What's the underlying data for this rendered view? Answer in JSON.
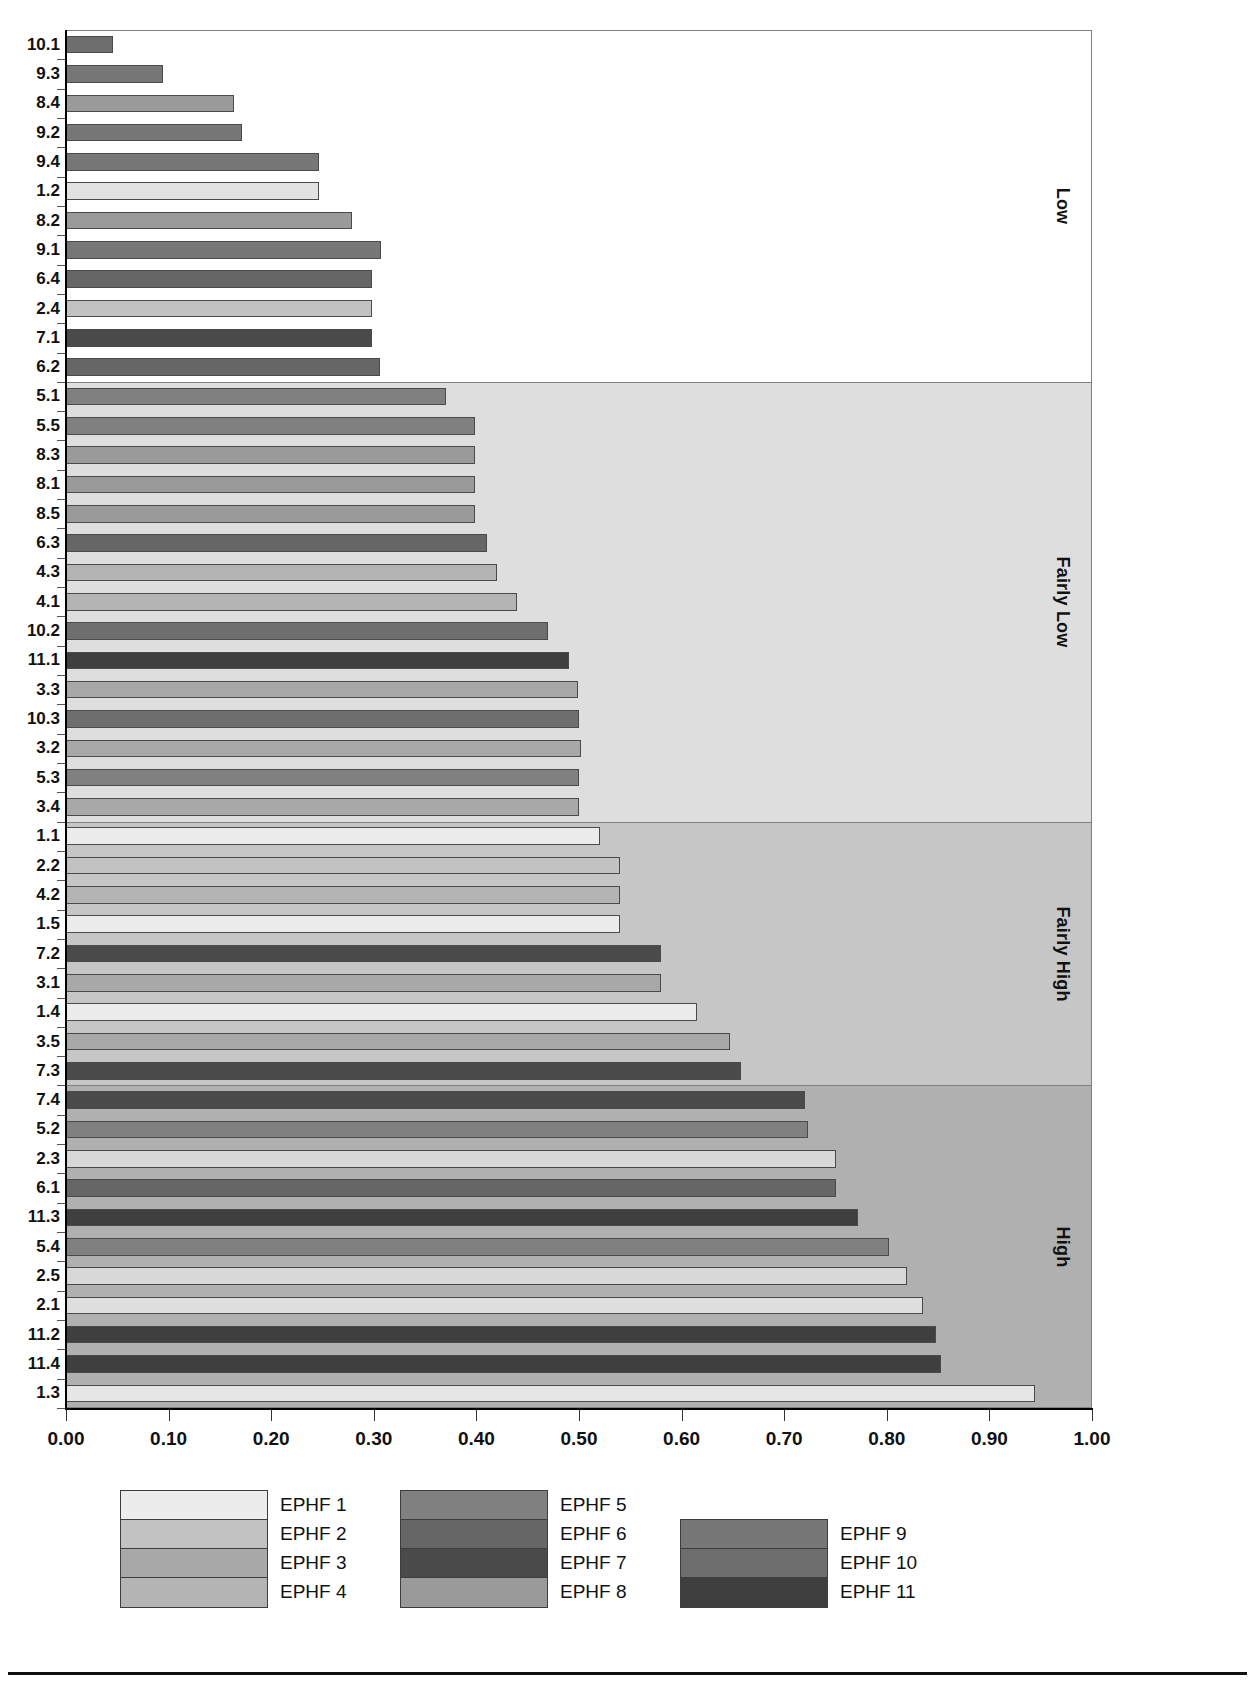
{
  "chart_data": {
    "type": "bar",
    "orientation": "horizontal",
    "title": "",
    "xlabel": "",
    "ylabel": "",
    "xlim": [
      0.0,
      1.0
    ],
    "xticks": [
      "0.00",
      "0.10",
      "0.20",
      "0.30",
      "0.40",
      "0.50",
      "0.60",
      "0.70",
      "0.80",
      "0.90",
      "1.00"
    ],
    "xtick_values": [
      0.0,
      0.1,
      0.2,
      0.3,
      0.4,
      0.5,
      0.6,
      0.7,
      0.8,
      0.9,
      1.0
    ],
    "grid": false,
    "legend_position": "bottom",
    "categories": [
      "10.1",
      "9.3",
      "8.4",
      "9.2",
      "9.4",
      "1.2",
      "8.2",
      "9.1",
      "6.4",
      "2.4",
      "7.1",
      "6.2",
      "5.1",
      "5.5",
      "8.3",
      "8.1",
      "8.5",
      "6.3",
      "4.3",
      "4.1",
      "10.2",
      "11.1",
      "3.3",
      "10.3",
      "3.2",
      "5.3",
      "3.4",
      "1.1",
      "2.2",
      "4.2",
      "1.5",
      "7.2",
      "3.1",
      "1.4",
      "3.5",
      "7.3",
      "7.4",
      "5.2",
      "2.3",
      "6.1",
      "11.3",
      "5.4",
      "2.5",
      "2.1",
      "11.2",
      "11.4",
      "1.3"
    ],
    "values": [
      0.046,
      0.095,
      0.164,
      0.172,
      0.247,
      0.247,
      0.279,
      0.307,
      0.298,
      0.298,
      0.298,
      0.306,
      0.37,
      0.399,
      0.399,
      0.399,
      0.399,
      0.41,
      0.42,
      0.44,
      0.47,
      0.49,
      0.499,
      0.5,
      0.502,
      0.5,
      0.5,
      0.52,
      0.54,
      0.54,
      0.54,
      0.58,
      0.58,
      0.615,
      0.647,
      0.658,
      0.72,
      0.723,
      0.75,
      0.75,
      0.772,
      0.802,
      0.82,
      0.835,
      0.848,
      0.853,
      0.944
    ],
    "series_of_bar": [
      "EPHF 10",
      "EPHF 9",
      "EPHF 8",
      "EPHF 9",
      "EPHF 9",
      "EPHF 1",
      "EPHF 8",
      "EPHF 9",
      "EPHF 6",
      "EPHF 2",
      "EPHF 7",
      "EPHF 6",
      "EPHF 5",
      "EPHF 5",
      "EPHF 8",
      "EPHF 8",
      "EPHF 8",
      "EPHF 6",
      "EPHF 4",
      "EPHF 4",
      "EPHF 10",
      "EPHF 11",
      "EPHF 3",
      "EPHF 10",
      "EPHF 3",
      "EPHF 5",
      "EPHF 3",
      "EPHF 1",
      "EPHF 2",
      "EPHF 4",
      "EPHF 1",
      "EPHF 7",
      "EPHF 3",
      "EPHF 1",
      "EPHF 3",
      "EPHF 7",
      "EPHF 7",
      "EPHF 5",
      "EPHF 2",
      "EPHF 6",
      "EPHF 11",
      "EPHF 5",
      "EPHF 2",
      "EPHF 2",
      "EPHF 11",
      "EPHF 11",
      "EPHF 1"
    ],
    "bar_colors": [
      "#6e6e6e",
      "#777777",
      "#9a9a9a",
      "#777777",
      "#777777",
      "#e2e2e2",
      "#9a9a9a",
      "#777777",
      "#666666",
      "#c2c2c2",
      "#4a4a4a",
      "#666666",
      "#808080",
      "#808080",
      "#9a9a9a",
      "#9a9a9a",
      "#9a9a9a",
      "#666666",
      "#b4b4b4",
      "#b4b4b4",
      "#6e6e6e",
      "#3f3f3f",
      "#a8a8a8",
      "#6e6e6e",
      "#a8a8a8",
      "#808080",
      "#a8a8a8",
      "#ececec",
      "#c2c2c2",
      "#b4b4b4",
      "#ececec",
      "#4a4a4a",
      "#a8a8a8",
      "#ececec",
      "#a8a8a8",
      "#4a4a4a",
      "#4a4a4a",
      "#808080",
      "#d8d8d8",
      "#666666",
      "#3f3f3f",
      "#808080",
      "#d8d8d8",
      "#dedede",
      "#3f3f3f",
      "#3f3f3f",
      "#e6e6e6"
    ],
    "bands": [
      {
        "label": "Low",
        "from_index": 0,
        "to_index": 11,
        "color": "#ffffff"
      },
      {
        "label": "Fairly Low",
        "from_index": 12,
        "to_index": 26,
        "color": "#dedede"
      },
      {
        "label": "Fairly High",
        "from_index": 27,
        "to_index": 35,
        "color": "#c6c6c6"
      },
      {
        "label": "High",
        "from_index": 36,
        "to_index": 46,
        "color": "#b0b0b0"
      }
    ],
    "legend": [
      {
        "label": "EPHF 1",
        "color": "#ececec"
      },
      {
        "label": "EPHF 2",
        "color": "#c2c2c2"
      },
      {
        "label": "EPHF 3",
        "color": "#a8a8a8"
      },
      {
        "label": "EPHF 4",
        "color": "#b4b4b4"
      },
      {
        "label": "EPHF 5",
        "color": "#808080"
      },
      {
        "label": "EPHF 6",
        "color": "#666666"
      },
      {
        "label": "EPHF 7",
        "color": "#4a4a4a"
      },
      {
        "label": "EPHF 8",
        "color": "#9a9a9a"
      },
      {
        "label": "EPHF 9",
        "color": "#777777"
      },
      {
        "label": "EPHF 10",
        "color": "#6e6e6e"
      },
      {
        "label": "EPHF 11",
        "color": "#3f3f3f"
      }
    ],
    "legend_groups": [
      {
        "items": [
          "EPHF 1",
          "EPHF 2",
          "EPHF 3",
          "EPHF 4"
        ]
      },
      {
        "items": [
          "EPHF 5",
          "EPHF 6",
          "EPHF 7",
          "EPHF 8"
        ]
      },
      {
        "items": [
          "EPHF 9",
          "EPHF 10",
          "EPHF 11"
        ]
      }
    ]
  }
}
